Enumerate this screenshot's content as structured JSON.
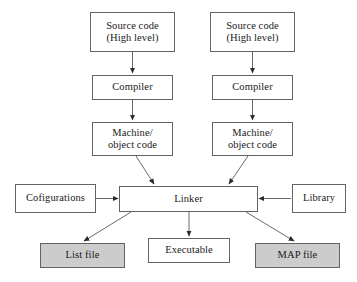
{
  "diagram": {
    "background_color": "#ffffff",
    "border_color": "#636363",
    "shaded_fill_color": "#cccccc",
    "plain_fill_color": "#ffffff",
    "nodes": {
      "source_left": {
        "line1": "Source code",
        "line2": "(High level)"
      },
      "source_right": {
        "line1": "Source code",
        "line2": "(High level)"
      },
      "compiler_left": {
        "line1": "Compiler"
      },
      "compiler_right": {
        "line1": "Compiler"
      },
      "objcode_left": {
        "line1": "Machine/",
        "line2": "object code"
      },
      "objcode_right": {
        "line1": "Machine/",
        "line2": "object code"
      },
      "configurations": {
        "line1": "Cofigurations"
      },
      "linker": {
        "line1": "Linker"
      },
      "library": {
        "line1": "Library"
      },
      "list_file": {
        "line1": "List file"
      },
      "executable": {
        "line1": "Executable"
      },
      "map_file": {
        "line1": "MAP file"
      }
    }
  }
}
